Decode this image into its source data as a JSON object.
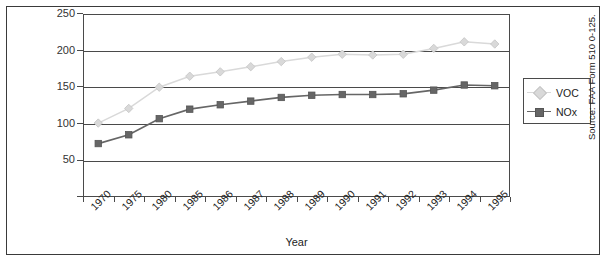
{
  "chart_data": {
    "type": "line",
    "title": "",
    "xlabel": "Year",
    "ylabel": "Emissions (1,000 Short Tons)",
    "categories": [
      "1970",
      "1975",
      "1980",
      "1985",
      "1986",
      "1987",
      "1988",
      "1989",
      "1990",
      "1991",
      "1992",
      "1993",
      "1994",
      "1995"
    ],
    "ylim": [
      0,
      250
    ],
    "yticks": [
      0,
      50,
      100,
      150,
      200,
      250
    ],
    "grid": true,
    "legend_position": "right",
    "series": [
      {
        "name": "VOC",
        "color": "#d9d9d9",
        "marker": "diamond",
        "values": [
          101,
          121,
          150,
          165,
          171,
          178,
          185,
          191,
          195,
          194,
          195,
          203,
          212,
          209
        ]
      },
      {
        "name": "NOx",
        "color": "#666666",
        "marker": "square",
        "values": [
          73,
          85,
          107,
          120,
          126,
          131,
          136,
          139,
          140,
          140,
          141,
          146,
          153,
          152
        ]
      }
    ]
  },
  "source_note": "Source: FAA Form 510 0-125.",
  "legend": {
    "entries": [
      {
        "label": "VOC"
      },
      {
        "label": "NOx"
      }
    ]
  },
  "colors": {
    "voc": "#d9d9d9",
    "nox": "#666666",
    "axis": "#4a4a4a",
    "border": "#3a3a3a",
    "text": "#222222"
  }
}
